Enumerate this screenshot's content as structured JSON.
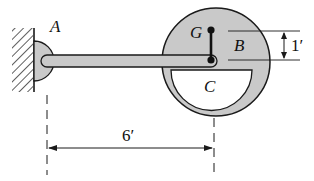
{
  "diagram": {
    "labels": {
      "pin": "A",
      "center_of_mass": "G",
      "disk": "B",
      "rod_end": "C"
    },
    "dimensions": {
      "horizontal": "6′",
      "vertical": "1′"
    },
    "colors": {
      "fill": "#c9c9c9",
      "stroke": "#1a1a1a",
      "background": "#ffffff"
    }
  }
}
